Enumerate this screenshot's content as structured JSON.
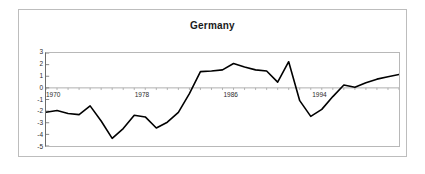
{
  "chart_data": {
    "type": "line",
    "title": "Germany",
    "xlabel": "",
    "ylabel": "",
    "grid": false,
    "legend": "none",
    "xlim": [
      1970,
      2002
    ],
    "ylim": [
      -5,
      3
    ],
    "y_ticks": [
      "3",
      "2",
      "1",
      "0",
      "-1",
      "-2",
      "-3",
      "-4",
      "-5"
    ],
    "y_tick_values": [
      3,
      2,
      1,
      0,
      -1,
      -2,
      -3,
      -4,
      -5
    ],
    "x_ticks": [
      "1970",
      "1978",
      "1986",
      "1994"
    ],
    "x_tick_values": [
      1970,
      1978,
      1986,
      1994
    ],
    "line_color": "#000000",
    "x": [
      1970,
      1971,
      1972,
      1973,
      1974,
      1975,
      1976,
      1977,
      1978,
      1979,
      1980,
      1981,
      1982,
      1983,
      1984,
      1985,
      1986,
      1987,
      1988,
      1989,
      1990,
      1991,
      1992,
      1993,
      1994,
      1995,
      1996,
      1997,
      1998,
      1999,
      2000,
      2001,
      2002
    ],
    "values": [
      -2.1,
      -1.95,
      -2.2,
      -2.3,
      -1.55,
      -2.85,
      -4.35,
      -3.5,
      -2.35,
      -2.5,
      -3.45,
      -2.95,
      -2.1,
      -0.5,
      1.4,
      1.45,
      1.55,
      2.1,
      1.8,
      1.55,
      1.45,
      0.5,
      2.25,
      -1.1,
      -2.45,
      -1.85,
      -0.75,
      0.25,
      0.05,
      0.45,
      0.75,
      0.95,
      1.15
    ]
  },
  "colors": {
    "frame_border": "#bdbdbd",
    "plot_border": "#b8b8b8",
    "axis": "#6b6b6b",
    "zero_line": "#9a9a9a",
    "line": "#000000",
    "text": "#2b2b2b",
    "background": "#ffffff"
  }
}
